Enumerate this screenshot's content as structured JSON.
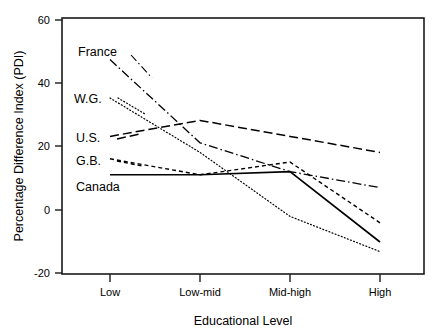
{
  "chart_data": {
    "type": "line",
    "title": "",
    "xlabel": "Educational Level",
    "ylabel": "Percentage Difference Index (PDI)",
    "categories": [
      "Low",
      "Low-mid",
      "Mid-high",
      "High"
    ],
    "xtick_labels": [
      "Low",
      "Low-mid",
      "Mid-high",
      "High"
    ],
    "ytick_labels": [
      "-20",
      "0",
      "20",
      "40",
      "60"
    ],
    "ytick_values": [
      -20,
      0,
      20,
      40,
      60
    ],
    "ylim": [
      -20,
      60
    ],
    "grid": false,
    "legend_position": "inline-left-labels",
    "series": [
      {
        "name": "France",
        "values": [
          47,
          21,
          12,
          7
        ],
        "style": "dashdot",
        "color": "#000000"
      },
      {
        "name": "W.G.",
        "values": [
          35,
          18,
          -2,
          -13
        ],
        "style": "dotted",
        "color": "#000000"
      },
      {
        "name": "U.S.",
        "values": [
          23,
          28,
          23,
          18
        ],
        "style": "dashed-long",
        "color": "#000000"
      },
      {
        "name": "G.B.",
        "values": [
          16,
          11,
          15,
          -4
        ],
        "style": "dashed-short",
        "color": "#000000"
      },
      {
        "name": "Canada",
        "values": [
          11,
          11,
          12,
          -10
        ],
        "style": "solid",
        "color": "#000000"
      }
    ],
    "series_labels": [
      "France",
      "W.G.",
      "U.S.",
      "G.B.",
      "Canada"
    ]
  }
}
